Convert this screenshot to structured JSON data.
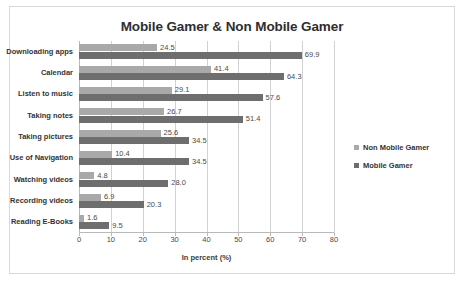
{
  "chart_data": {
    "type": "bar",
    "orientation": "horizontal",
    "title": "Mobile Gamer & Non Mobile Gamer",
    "xlabel": "In percent (%)",
    "ylabel": "",
    "xlim": [
      0,
      80
    ],
    "xticks": [
      0,
      10,
      20,
      30,
      40,
      50,
      60,
      70,
      80
    ],
    "grid": true,
    "legend_position": "right",
    "categories": [
      "Downloading apps",
      "Calendar",
      "Listen to music",
      "Taking notes",
      "Taking pictures",
      "Use of Navigation",
      "Watching videos",
      "Recording videos",
      "Reading E-Books"
    ],
    "series": [
      {
        "name": "Non Mobile Gamer",
        "color": "#a9a9a9",
        "values": [
          24.5,
          41.4,
          29.1,
          26.7,
          25.6,
          10.4,
          4.8,
          6.9,
          1.6
        ],
        "labels": [
          "24.5",
          "41.4",
          "29.1",
          "26.7",
          "25.6",
          "10.4",
          "4.8",
          "6.9",
          "1.6"
        ]
      },
      {
        "name": "Mobile Gamer",
        "color": "#6e6e6e",
        "values": [
          69.9,
          64.3,
          57.6,
          51.4,
          34.5,
          34.5,
          28.0,
          20.3,
          9.5
        ],
        "labels": [
          "69.9",
          "64.3",
          "57.6",
          "51.4",
          "34.5",
          "34.5",
          "28.0",
          "20.3",
          "9.5"
        ]
      }
    ]
  }
}
